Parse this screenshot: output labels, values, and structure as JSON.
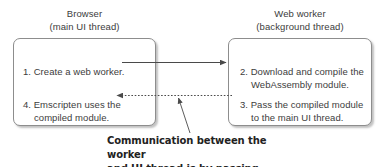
{
  "diagram": {
    "columns": [
      {
        "id": "browser",
        "title": "Browser",
        "subtitle": "(main UI thread)"
      },
      {
        "id": "web-worker",
        "title": "Web worker",
        "subtitle": "(background thread)"
      }
    ],
    "steps": [
      {
        "id": "step-1",
        "column": "browser",
        "number": "1.",
        "line1": "1. Create a web worker.",
        "line2": ""
      },
      {
        "id": "step-4",
        "column": "browser",
        "number": "4.",
        "line1": "4. Emscripten uses the",
        "line2": "compiled module."
      },
      {
        "id": "step-2",
        "column": "web-worker",
        "number": "2.",
        "line1": "2. Download and compile the",
        "line2": "WebAssembly module."
      },
      {
        "id": "step-3",
        "column": "web-worker",
        "number": "3.",
        "line1": "3. Pass the compiled module",
        "line2": "to the main UI thread."
      }
    ],
    "connectors": [
      {
        "id": "arrow-create-worker",
        "style": "solid",
        "direction": "left-to-right",
        "from": "step-1",
        "to": "step-2"
      },
      {
        "id": "arrow-pass-module",
        "style": "dashed",
        "direction": "right-to-left",
        "from": "step-3",
        "to": "step-4"
      },
      {
        "id": "callout-leader",
        "style": "solid-thin",
        "direction": "caption-to-dashed-arrow",
        "from": "caption",
        "to": "arrow-pass-module"
      }
    ],
    "caption": {
      "line1": "Communication between the worker",
      "line2": "and UI thread is by passing messages."
    },
    "colors": {
      "text": "#3c3c3c",
      "caption_text": "#222222",
      "box_border": "#8d8d8d",
      "box_fill": "#ffffff",
      "connector": "#4a4a4a",
      "background": "#ffffff"
    }
  }
}
